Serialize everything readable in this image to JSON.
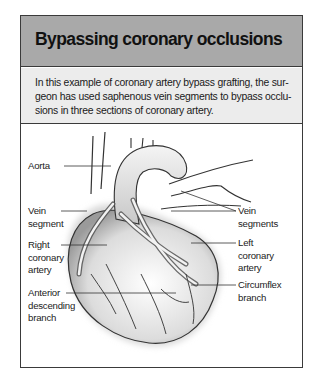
{
  "figure_box": {
    "title": "Bypassing coronary occlusions",
    "caption": "In this example of coronary artery bypass grafting, the sur-\ngeon has used saphenous vein segments to bypass occlu-\nsions in three sections of coronary artery.",
    "illustration": {
      "subject": "heart-with-bypass-grafts",
      "labels": {
        "aorta": "Aorta",
        "vein_segment": "Vein\nsegment",
        "right_coronary_artery": "Right\ncoronary\nartery",
        "anterior_descending_branch": "Anterior\ndescending\nbranch",
        "vein_segments": "Vein\nsegments",
        "left_coronary_artery": "Left\ncoronary\nartery",
        "circumflex_branch": "Circumflex\nbranch"
      }
    }
  },
  "colors": {
    "header_bg": "#a9a9a9",
    "caption_bg": "#ececec",
    "border": "#3a3a3a"
  }
}
